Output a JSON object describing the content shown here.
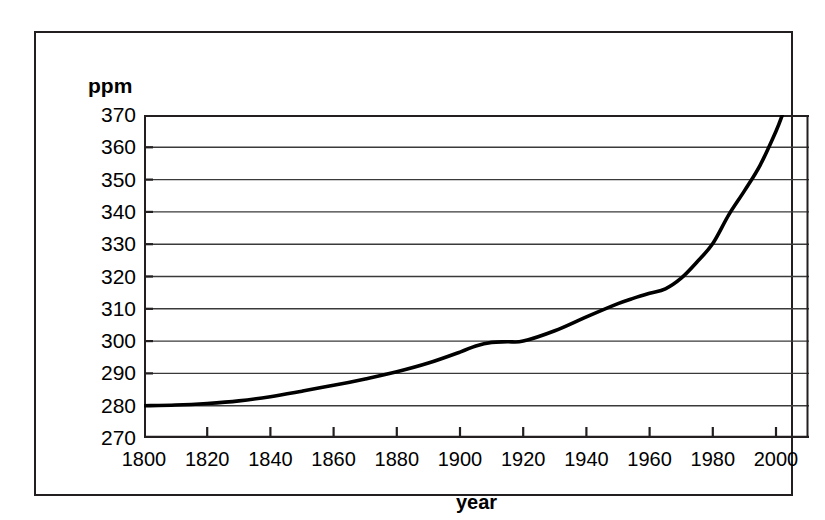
{
  "chart_data": {
    "type": "line",
    "title": "",
    "subtitle": "",
    "xlabel": "year",
    "ylabel": "ppm",
    "xlim": [
      1795,
      2005
    ],
    "ylim": [
      270,
      370
    ],
    "grid": "horizontal",
    "legend": "none",
    "series_color": "#000000",
    "x_ticks": [
      1800,
      1820,
      1840,
      1860,
      1880,
      1900,
      1920,
      1940,
      1960,
      1980,
      2000
    ],
    "y_ticks": [
      270,
      280,
      290,
      300,
      310,
      320,
      330,
      340,
      350,
      360,
      370
    ],
    "series": [
      {
        "name": "atmospheric CO2 concentration",
        "x": [
          1800,
          1810,
          1820,
          1830,
          1840,
          1850,
          1860,
          1870,
          1880,
          1890,
          1900,
          1905,
          1910,
          1915,
          1920,
          1930,
          1940,
          1950,
          1955,
          1960,
          1965,
          1970,
          1975,
          1980,
          1985,
          1990,
          1995,
          2000,
          2002
        ],
        "values": [
          280,
          280.2,
          280.7,
          281.5,
          282.8,
          284.5,
          286.3,
          288.3,
          290.5,
          293.2,
          296.6,
          298.5,
          299.6,
          299.8,
          300.0,
          303.2,
          307.5,
          311.6,
          313.3,
          314.8,
          316.2,
          319.5,
          324.5,
          330.2,
          339.0,
          346.5,
          354.5,
          365.0,
          370.0
        ]
      }
    ]
  },
  "axes": {
    "y_unit_label": "ppm",
    "x_axis_title": "year",
    "y_tick_labels": [
      "370",
      "360",
      "350",
      "340",
      "330",
      "320",
      "310",
      "300",
      "290",
      "280",
      "270"
    ],
    "x_tick_labels": [
      "1800",
      "1820",
      "1840",
      "1860",
      "1880",
      "1900",
      "1920",
      "1940",
      "1960",
      "1980",
      "2000"
    ]
  },
  "colors": {
    "frame": "#231f20",
    "gridline": "#3a3a3a",
    "curve": "#000000",
    "background": "#ffffff"
  }
}
